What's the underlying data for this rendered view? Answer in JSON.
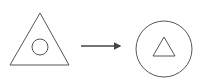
{
  "diagram": {
    "stroke_color": "#555555",
    "background": "#ffffff",
    "source": {
      "outer_shape": "triangle",
      "inner_shape": "circle"
    },
    "connector": "arrow-right",
    "target": {
      "outer_shape": "circle",
      "inner_shape": "triangle"
    }
  }
}
